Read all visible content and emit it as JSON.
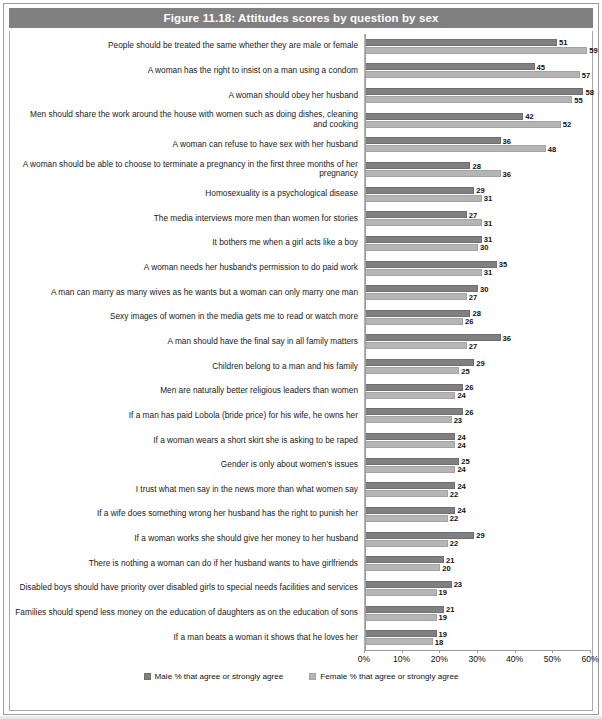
{
  "figure": {
    "title": "Figure 11.18: Attitudes scores by question by sex",
    "title_bar_color": "#808080",
    "title_text_color": "#ffffff",
    "frame_color": "#9b9b9b"
  },
  "legend": {
    "position": "bottom-center",
    "entries": [
      {
        "label": "Male % that agree or strongly agree",
        "color": "#808080",
        "swatch_name": "legend-swatch-male"
      },
      {
        "label": "Female % that agree or strongly agree",
        "color": "#b5b5b5",
        "swatch_name": "legend-swatch-female"
      }
    ]
  },
  "axis": {
    "tick_labels": [
      "0%",
      "10%",
      "20%",
      "30%",
      "40%",
      "50%",
      "60%"
    ],
    "min": 0,
    "max": 60,
    "step": 10,
    "gridlines": true
  },
  "chart_data": {
    "type": "bar",
    "orientation": "horizontal",
    "title": "Figure 11.18: Attitudes scores by question by sex",
    "xlabel": "",
    "ylabel": "",
    "xlim": [
      0,
      60
    ],
    "xticks": [
      0,
      10,
      20,
      30,
      40,
      50,
      60
    ],
    "xtick_labels": [
      "0%",
      "10%",
      "20%",
      "30%",
      "40%",
      "50%",
      "60%"
    ],
    "grid": true,
    "legend_position": "bottom",
    "categories": [
      "People should be treated the same whether they are male or female",
      "A woman has the right to insist on a man using a condom",
      "A woman should obey her husband",
      "Men should share the work around the house with women such as doing dishes, cleaning and cooking",
      "A woman can refuse to have sex with her husband",
      "A woman should be able to choose to terminate a pregnancy in the first three months of her pregnancy",
      "Homosexuality is a psychological disease",
      "The media interviews more men than women for stories",
      "It bothers me when a girl acts like a boy",
      "A woman needs her husband's permission to do paid work",
      "A man can marry as many wives as he wants but a woman can only marry one man",
      "Sexy images of women in the media gets me to read or watch more",
      "A man should have the final say in all family matters",
      "Children belong to a man and his family",
      "Men are naturally better religious leaders than women",
      "If a man has paid Lobola (bride price) for his wife, he owns her",
      "If a woman wears a short skirt she is asking to be raped",
      "Gender is only about women's issues",
      "I trust what men say in the news more than what women say",
      "If a wife does something wrong her husband has the right to punish her",
      "If a woman works she should give her money to her husband",
      "There is nothing a woman can do if her husband wants to have girlfriends",
      "Disabled boys should have priority over disabled girls to special needs facilities and services",
      "Families should spend less money on the education of daughters as on the education of sons",
      "If a man beats a woman it shows that he loves her"
    ],
    "series": [
      {
        "name": "Male % that agree or strongly agree",
        "color": "#808080",
        "values": [
          51,
          45,
          58,
          42,
          36,
          28,
          29,
          27,
          31,
          35,
          30,
          28,
          36,
          29,
          26,
          26,
          24,
          25,
          24,
          24,
          29,
          21,
          23,
          21,
          19
        ]
      },
      {
        "name": "Female % that agree or strongly agree",
        "color": "#b5b5b5",
        "values": [
          59,
          57,
          55,
          52,
          48,
          36,
          31,
          31,
          30,
          31,
          27,
          26,
          27,
          25,
          24,
          23,
          24,
          24,
          22,
          22,
          22,
          20,
          19,
          19,
          18
        ]
      }
    ]
  }
}
